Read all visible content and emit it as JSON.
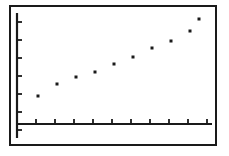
{
  "device": {
    "name": "graphing-calculator",
    "screen_label": "scatter plot display"
  },
  "colors": {
    "ink": "#1a1a1a",
    "background": "#ffffff",
    "bezel": "#1a1a1a"
  },
  "axes": {
    "y_axis": {
      "label": "",
      "visible": true,
      "tick_count": 7,
      "tick_direction": "right",
      "tick_length_px": 5
    },
    "x_axis": {
      "label": "",
      "visible": true,
      "tick_count": 10,
      "tick_direction": "up",
      "tick_length_px": 5
    },
    "grid": false,
    "tick_labels_shown": false,
    "axis_numbers_shown": false
  },
  "chart_data": {
    "type": "scatter",
    "title": "",
    "subtitle": "",
    "xlabel": "",
    "ylabel": "",
    "grid": false,
    "legend": null,
    "legend_position": "none",
    "xlim": [
      0,
      11
    ],
    "ylim": [
      0,
      11
    ],
    "x_tick_values": [
      1,
      2,
      3,
      4,
      5,
      6,
      7,
      8,
      9,
      10
    ],
    "y_tick_values": [
      1,
      2,
      3,
      4,
      5,
      6,
      7
    ],
    "marker": "square",
    "marker_size_px": 3,
    "marker_color": "#1a1a1a",
    "point_count": 10,
    "x": [
      1,
      2,
      3,
      4,
      5,
      6,
      7,
      8,
      9,
      10
    ],
    "y": [
      2.1,
      3.0,
      3.6,
      4.2,
      4.9,
      5.8,
      6.6,
      7.4,
      8.4,
      9.4
    ],
    "points": [
      {
        "x": 1,
        "y": 2.1
      },
      {
        "x": 2,
        "y": 3.0
      },
      {
        "x": 3,
        "y": 3.6
      },
      {
        "x": 4,
        "y": 4.2
      },
      {
        "x": 5,
        "y": 4.9
      },
      {
        "x": 6,
        "y": 5.8
      },
      {
        "x": 7,
        "y": 6.6
      },
      {
        "x": 8,
        "y": 7.4
      },
      {
        "x": 9,
        "y": 8.4
      },
      {
        "x": 10,
        "y": 9.4
      }
    ],
    "pixel_points": [
      {
        "cx": 38,
        "cy": 96
      },
      {
        "cx": 57,
        "cy": 84
      },
      {
        "cx": 76,
        "cy": 77
      },
      {
        "cx": 95,
        "cy": 72
      },
      {
        "cx": 114,
        "cy": 64
      },
      {
        "cx": 133,
        "cy": 57
      },
      {
        "cx": 152,
        "cy": 48
      },
      {
        "cx": 171,
        "cy": 41
      },
      {
        "cx": 190,
        "cy": 31
      },
      {
        "cx": 199,
        "cy": 19
      }
    ],
    "annotations": [],
    "trend": "increasing"
  },
  "geometry": {
    "y_axis_x_px": 17,
    "y_axis_top_px": 13,
    "y_axis_bottom_px": 138,
    "x_axis_y_px": 124,
    "x_axis_left_px": 17,
    "x_axis_right_px": 212,
    "y_tick_y_px": [
      22,
      40,
      58,
      76,
      94,
      112,
      130
    ],
    "x_tick_x_px": [
      36,
      55,
      74,
      93,
      112,
      131,
      150,
      169,
      188,
      207
    ]
  }
}
